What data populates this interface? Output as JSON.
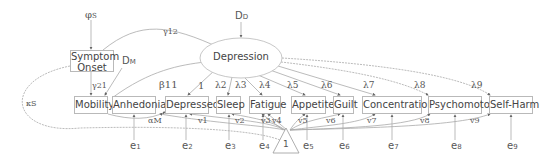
{
  "diagram": {
    "type": "structural equation model path diagram",
    "latent": {
      "label": "Depression",
      "disturbance": "DD"
    },
    "exogenous": {
      "label": "Symptom Onset",
      "disturbance": "φS"
    },
    "mediator": {
      "label": "Mobility",
      "disturbance": "DM"
    },
    "indicators": [
      {
        "label": "Anhedonia",
        "loading": "β11",
        "intercept": "αM",
        "error": "e1"
      },
      {
        "label": "Depressed",
        "loading": "1",
        "intercept": "v1",
        "error": "e2"
      },
      {
        "label": "Sleep",
        "loading": "λ2",
        "intercept": "v2",
        "error": "e3"
      },
      {
        "label": "Fatigue",
        "loading": "λ3",
        "intercept": "v3",
        "error": "e4"
      },
      {
        "label": "Appetite",
        "loading": "λ4",
        "intercept": "v4",
        "error": "e5"
      },
      {
        "label": "Guilt",
        "loading": "λ5",
        "intercept": "v5",
        "error": "e6"
      },
      {
        "label": "Concentration",
        "loading": "λ7",
        "intercept": "v7",
        "error": "e7"
      },
      {
        "label": "Psychomotor",
        "loading": "λ8",
        "intercept": "v8",
        "error": "e8"
      },
      {
        "label": "Self-Harm",
        "loading": "λ9",
        "intercept": "v9",
        "error": "e9"
      }
    ],
    "extra_labels": {
      "lambda6": "λ6",
      "v6": "v6",
      "gamma12": "γ12",
      "gamma21": "γ21",
      "kappa": "κS",
      "constant": "1"
    }
  },
  "nodes": {
    "symptom_onset_line1": "Symptom",
    "symptom_onset_line2": "Onset",
    "depression": "Depression",
    "mobility": "Mobility",
    "anhedonia": "Anhedonia",
    "depressed": "Depressed",
    "sleep": "Sleep",
    "fatigue": "Fatigue",
    "appetite": "Appetite",
    "guilt": "Guilt",
    "concentration": "Concentration",
    "psychomotor": "Psychomotor",
    "self_harm": "Self-Harm",
    "constant": "1"
  },
  "labels": {
    "phi": "φ",
    "phi_sub": "S",
    "dd": "D",
    "dd_sub": "D",
    "dm": "D",
    "dm_sub": "M",
    "gamma12": "γ12",
    "gamma21": "γ21",
    "kappa": "κS",
    "beta11": "β11",
    "one": "1",
    "l2": "λ2",
    "l3": "λ3",
    "l4": "λ4",
    "l5": "λ5",
    "l6": "λ6",
    "l7": "λ7",
    "l8": "λ8",
    "l9": "λ9",
    "alphaM": "αM",
    "v1": "v1",
    "v2": "v2",
    "v3": "v3",
    "v4": "v4",
    "v5": "v5",
    "v6": "v6",
    "v7": "v7",
    "v8": "v8",
    "v9": "v9",
    "e1": "e",
    "e2": "e",
    "e3": "e",
    "e4": "e",
    "e5": "e",
    "e6": "e",
    "e7": "e",
    "e8": "e",
    "e9": "e",
    "e1s": "1",
    "e2s": "2",
    "e3s": "3",
    "e4s": "4",
    "e5s": "5",
    "e6s": "6",
    "e7s": "7",
    "e8s": "8",
    "e9s": "9"
  }
}
